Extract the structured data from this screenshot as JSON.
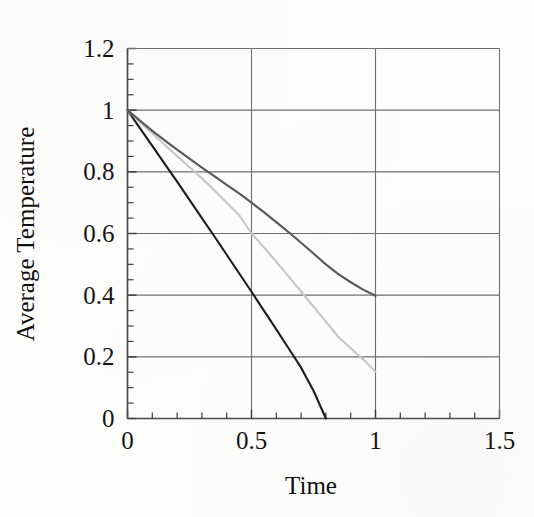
{
  "figure": {
    "background_color": "#fefefd",
    "plot_frame_color": "#4a4a4a",
    "gridline_color": "#6e6e6e",
    "tick_color": "#3c3c3c",
    "text_color": "#141414"
  },
  "chart_data": {
    "type": "line",
    "title": "",
    "subtitle": "",
    "xlabel": "Time",
    "ylabel": "Average Temperature",
    "xlim": [
      0,
      1.5
    ],
    "ylim": [
      0,
      1.2
    ],
    "grid": true,
    "grid_axes": "both",
    "legend": null,
    "legend_position": "none",
    "x_ticks": [
      0,
      0.5,
      1,
      1.5
    ],
    "x_tick_labels": [
      "0",
      "0.5",
      "1",
      "1.5"
    ],
    "x_minor_tick_step": 0.1,
    "y_ticks": [
      0,
      0.2,
      0.4,
      0.6,
      0.8,
      1,
      1.2
    ],
    "y_tick_labels": [
      "0",
      "0.2",
      "0.4",
      "0.6",
      "0.8",
      "1",
      "1.2"
    ],
    "y_minor_tick_step": 0.05,
    "series": [
      {
        "name": "curve-steep",
        "color": "#1c1c1c",
        "line_width": 2.1,
        "x": [
          0.0,
          0.05,
          0.1,
          0.15,
          0.2,
          0.25,
          0.3,
          0.35,
          0.4,
          0.45,
          0.5,
          0.55,
          0.6,
          0.65,
          0.7,
          0.75,
          0.8
        ],
        "values": [
          1.0,
          0.942,
          0.884,
          0.826,
          0.768,
          0.709,
          0.65,
          0.591,
          0.531,
          0.471,
          0.411,
          0.35,
          0.289,
          0.227,
          0.165,
          0.09,
          0.0
        ]
      },
      {
        "name": "curve-middle",
        "color": "#c6c6c6",
        "line_width": 2.1,
        "x": [
          0.0,
          0.05,
          0.1,
          0.15,
          0.2,
          0.25,
          0.3,
          0.35,
          0.4,
          0.45,
          0.5,
          0.55,
          0.6,
          0.65,
          0.7,
          0.75,
          0.8,
          0.85,
          0.9,
          0.95,
          1.0
        ],
        "values": [
          1.0,
          0.962,
          0.925,
          0.888,
          0.851,
          0.815,
          0.779,
          0.74,
          0.7,
          0.66,
          0.6,
          0.555,
          0.508,
          0.46,
          0.412,
          0.363,
          0.314,
          0.265,
          0.228,
          0.192,
          0.152
        ]
      },
      {
        "name": "curve-shallow",
        "color": "#5a5a5a",
        "line_width": 2.2,
        "x": [
          0.0,
          0.05,
          0.1,
          0.15,
          0.2,
          0.25,
          0.3,
          0.35,
          0.4,
          0.45,
          0.5,
          0.55,
          0.6,
          0.65,
          0.7,
          0.75,
          0.8,
          0.85,
          0.9,
          0.95,
          1.0
        ],
        "values": [
          1.0,
          0.966,
          0.933,
          0.902,
          0.872,
          0.843,
          0.814,
          0.786,
          0.758,
          0.73,
          0.7,
          0.669,
          0.637,
          0.604,
          0.57,
          0.535,
          0.5,
          0.468,
          0.442,
          0.418,
          0.398
        ]
      }
    ],
    "annotations": []
  }
}
